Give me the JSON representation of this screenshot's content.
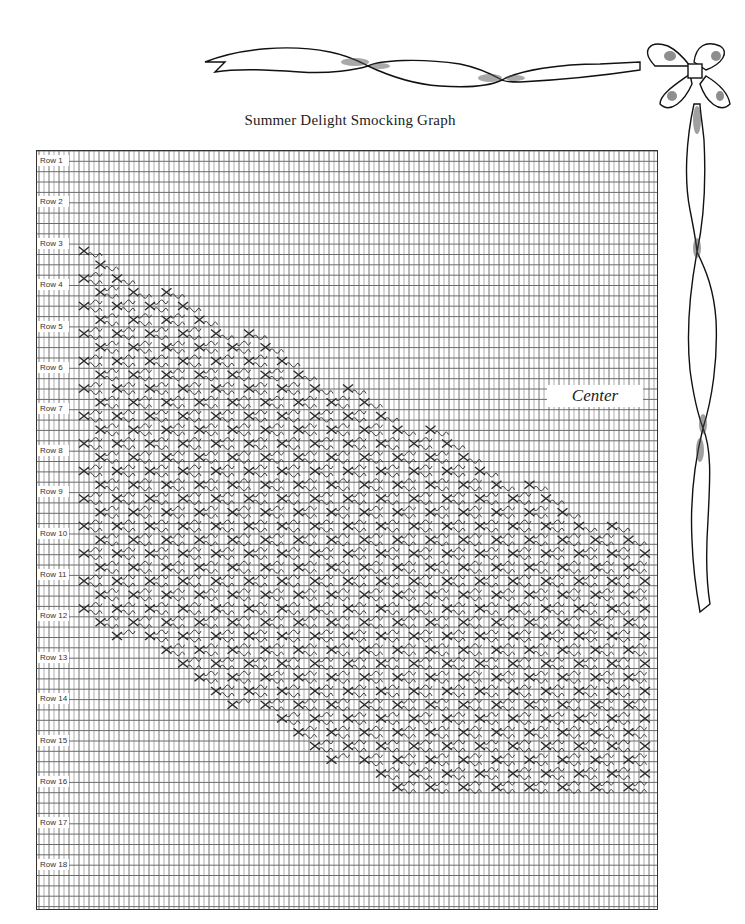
{
  "title": "Summer Delight Smocking Graph",
  "center_label": "Center",
  "rows": [
    {
      "label": "Row 1"
    },
    {
      "label": "Row 2"
    },
    {
      "label": "Row 3"
    },
    {
      "label": "Row 4"
    },
    {
      "label": "Row 5"
    },
    {
      "label": "Row 6"
    },
    {
      "label": "Row 7"
    },
    {
      "label": "Row 8"
    },
    {
      "label": "Row 9"
    },
    {
      "label": "Row 10"
    },
    {
      "label": "Row 11"
    },
    {
      "label": "Row 12"
    },
    {
      "label": "Row 13"
    },
    {
      "label": "Row 14"
    },
    {
      "label": "Row 15"
    },
    {
      "label": "Row 16"
    },
    {
      "label": "Row 17"
    },
    {
      "label": "Row 18"
    }
  ],
  "grid": {
    "vline_spacing": 5,
    "hline_spacing": 10.35,
    "row_spacing": 41.4,
    "line_color": "#8a8a8a",
    "stitch_color": "#2a2a2a"
  },
  "decorations": [
    "ribbon",
    "bow"
  ]
}
